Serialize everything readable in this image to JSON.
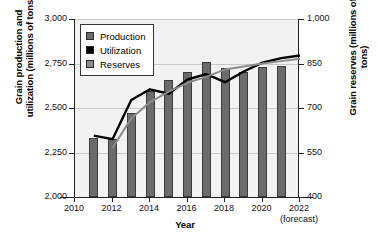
{
  "chart_data": {
    "type": "bar",
    "title": "",
    "xlabel": "Year",
    "ylabel": "Grain production and utilization (millions of tons)",
    "ylabel_right": "Grain reserves (millions of tons)",
    "categories": [
      2011,
      2012,
      2013,
      2014,
      2015,
      2016,
      2017,
      2018,
      2019,
      2020,
      2021
    ],
    "xlim": [
      2010,
      2022
    ],
    "xticks": [
      "2010",
      "2012",
      "2014",
      "2016",
      "2018",
      "2020",
      "2022"
    ],
    "xtick_values": [
      2010,
      2012,
      2014,
      2016,
      2018,
      2020,
      2022
    ],
    "forecast_note": "(forecast)",
    "ylim": [
      2000,
      3000
    ],
    "yticks": [
      "2,000",
      "2,250",
      "2,500",
      "2,750",
      "3,000"
    ],
    "ytick_values": [
      2000,
      2250,
      2500,
      2750,
      3000
    ],
    "ylim_right": [
      400,
      1000
    ],
    "yticks_right": [
      "400",
      "550",
      "700",
      "850",
      "1,000"
    ],
    "ytick_values_right": [
      400,
      550,
      700,
      850,
      1000
    ],
    "grid": true,
    "legend_position": "upper-left",
    "series": [
      {
        "name": "Production",
        "type": "bar",
        "axis": "left",
        "color": "#6b6b6b",
        "x": [
          2011,
          2012,
          2013,
          2014,
          2015,
          2016,
          2017,
          2018,
          2019,
          2020,
          2021
        ],
        "values": [
          2330,
          2325,
          2470,
          2595,
          2655,
          2700,
          2760,
          2725,
          2700,
          2730,
          2735
        ]
      },
      {
        "name": "Utilization",
        "type": "line",
        "axis": "left",
        "color": "#000000",
        "x": [
          2011,
          2012,
          2013,
          2014,
          2015,
          2016,
          2017,
          2018,
          2019,
          2020,
          2021,
          2022
        ],
        "values": [
          2345,
          2325,
          2545,
          2605,
          2580,
          2660,
          2690,
          2645,
          2705,
          2755,
          2780,
          2795
        ]
      },
      {
        "name": "Reserves",
        "type": "line",
        "axis": "right",
        "color": "#8c8c8c",
        "x": [
          2012,
          2013,
          2014,
          2015,
          2016,
          2017,
          2018,
          2019,
          2020,
          2021,
          2022
        ],
        "values": [
          565,
          665,
          720,
          755,
          785,
          805,
          830,
          840,
          850,
          858,
          866
        ]
      }
    ],
    "legend": [
      {
        "label": "Production",
        "color": "#6b6b6b"
      },
      {
        "label": "Utilization",
        "color": "#000000"
      },
      {
        "label": "Reserves",
        "color": "#8c8c8c"
      }
    ]
  }
}
